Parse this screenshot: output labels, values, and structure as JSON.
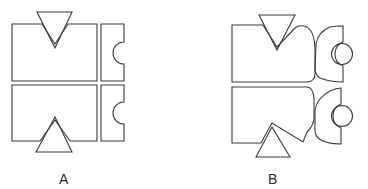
{
  "figures": [
    {
      "id": "A",
      "label": "A",
      "description": "Two rectangular blocks with V-notches aligned to triangular markers, plus two right-side pieces with semicircular notches"
    },
    {
      "id": "B",
      "label": "B",
      "description": "Deformed blocks with rounded right corners, offset triangles, and D-shaped pieces holding circles"
    }
  ],
  "colors": {
    "stroke": "#3a3a3a",
    "background": "#ffffff"
  }
}
